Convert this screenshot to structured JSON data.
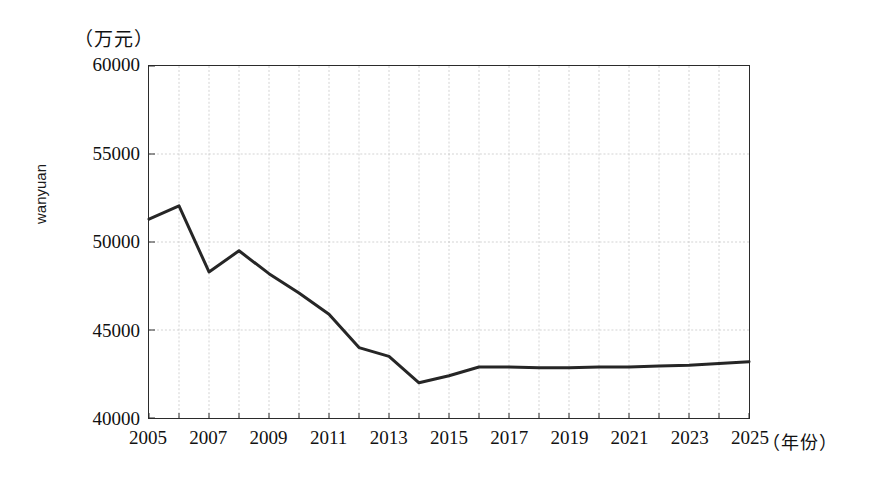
{
  "chart_data": {
    "type": "line",
    "title": "",
    "subtitle": "",
    "xlabel": "（年份）",
    "ylabel": "wanyuan",
    "y_unit_label": "（万元）",
    "x": [
      2005,
      2006,
      2007,
      2008,
      2009,
      2010,
      2011,
      2012,
      2013,
      2014,
      2015,
      2016,
      2017,
      2018,
      2019,
      2020,
      2021,
      2022,
      2023,
      2024,
      2025
    ],
    "values": [
      51300,
      52050,
      48300,
      49500,
      48200,
      47100,
      45900,
      44000,
      43500,
      42000,
      42400,
      42900,
      42900,
      42850,
      42850,
      42900,
      42900,
      42950,
      43000,
      43100,
      43200
    ],
    "series": [
      {
        "name": "wanyuan",
        "values": [
          51300,
          52050,
          48300,
          49500,
          48200,
          47100,
          45900,
          44000,
          43500,
          42000,
          42400,
          42900,
          42900,
          42850,
          42850,
          42900,
          42900,
          42950,
          43000,
          43100,
          43200
        ]
      }
    ],
    "xlim": [
      2005,
      2025
    ],
    "ylim": [
      40000,
      60000
    ],
    "y_ticks": [
      40000,
      45000,
      50000,
      55000,
      60000
    ],
    "y_tick_labels": [
      "40000",
      "45000",
      "50000",
      "55000",
      "60000"
    ],
    "x_ticks": [
      2005,
      2007,
      2009,
      2011,
      2013,
      2015,
      2017,
      2019,
      2021,
      2023,
      2025
    ],
    "x_tick_labels": [
      "2005",
      "2007",
      "2009",
      "2011",
      "2013",
      "2015",
      "2017",
      "2019",
      "2021",
      "2023",
      "2025"
    ],
    "x_minor_step": 1,
    "grid": true,
    "grid_color": "#c8c8c8",
    "line_color": "#262626",
    "line_width": 3,
    "frame_color": "#2b2b2b",
    "legend": false,
    "legend_position": "none",
    "background": "#ffffff",
    "annotations": []
  }
}
